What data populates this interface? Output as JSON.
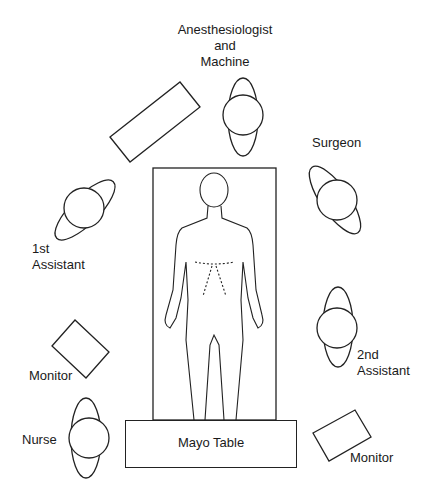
{
  "people": [
    {
      "id": "anesthesiologist",
      "label_lines": [
        "Anesthesiologist",
        "and",
        "Machine"
      ]
    },
    {
      "id": "surgeon",
      "label_lines": [
        "Surgeon"
      ]
    },
    {
      "id": "first-assistant",
      "label_lines": [
        "1st",
        "Assistant"
      ]
    },
    {
      "id": "second-assistant",
      "label_lines": [
        "2nd",
        "Assistant"
      ]
    },
    {
      "id": "nurse",
      "label_lines": [
        "Nurse"
      ]
    }
  ],
  "equipment": {
    "mayo_table": "Mayo Table",
    "monitor_left": "Monitor",
    "monitor_right": "Monitor"
  },
  "colors": {
    "line": "#222222",
    "background": "#ffffff"
  }
}
